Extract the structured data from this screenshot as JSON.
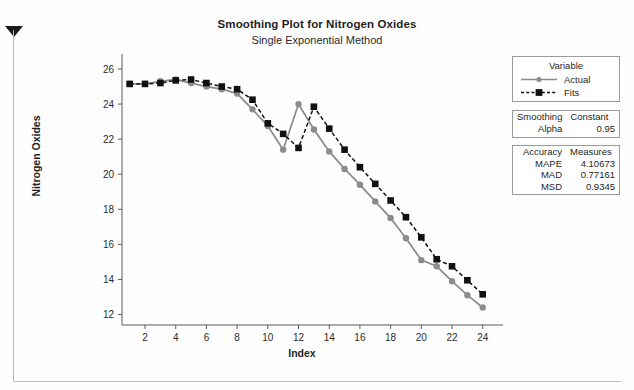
{
  "chart_data": {
    "type": "line",
    "title": "Smoothing Plot for Nitrogen Oxides",
    "subtitle": "Single Exponential Method",
    "xlabel": "Index",
    "ylabel": "Nitrogen Oxides",
    "xlim": [
      0.5,
      24.8
    ],
    "ylim": [
      11.4,
      26.4
    ],
    "xticks": [
      2,
      4,
      6,
      8,
      10,
      12,
      14,
      16,
      18,
      20,
      22,
      24
    ],
    "yticks": [
      12,
      14,
      16,
      18,
      20,
      22,
      24,
      26
    ],
    "grid": false,
    "legend_position": "right-top",
    "x": [
      1,
      2,
      3,
      4,
      5,
      6,
      7,
      8,
      9,
      10,
      11,
      12,
      13,
      14,
      15,
      16,
      17,
      18,
      19,
      20,
      21,
      22,
      23,
      24
    ],
    "series": [
      {
        "name": "Actual",
        "color": "#8c8c8c",
        "marker": "circle",
        "linestyle": "solid",
        "values": [
          25.15,
          25.15,
          25.3,
          25.4,
          25.2,
          25.0,
          24.85,
          24.6,
          23.7,
          22.75,
          21.4,
          24.0,
          22.55,
          21.3,
          20.3,
          19.4,
          18.45,
          17.5,
          16.35,
          15.1,
          14.75,
          13.9,
          13.1,
          12.4
        ]
      },
      {
        "name": "Fits",
        "color": "#111111",
        "marker": "square",
        "linestyle": "dashed",
        "values": [
          25.15,
          25.15,
          25.2,
          25.35,
          25.4,
          25.2,
          25.0,
          24.85,
          24.25,
          22.9,
          22.3,
          21.5,
          23.85,
          22.6,
          21.4,
          20.4,
          19.45,
          18.5,
          17.55,
          16.4,
          15.15,
          14.75,
          13.95,
          13.15
        ]
      }
    ]
  },
  "legend": {
    "title": "Variable",
    "entries": [
      {
        "label": "Actual"
      },
      {
        "label": "Fits"
      }
    ]
  },
  "smoothing_box": {
    "header_left": "Smoothing",
    "header_right": "Constant",
    "key": "Alpha",
    "value": "0.95"
  },
  "accuracy_box": {
    "header_left": "Accuracy",
    "header_right": "Measures",
    "rows": [
      {
        "key": "MAPE",
        "value": "4.10673"
      },
      {
        "key": "MAD",
        "value": "0.77161"
      },
      {
        "key": "MSD",
        "value": "0.9345"
      }
    ]
  }
}
